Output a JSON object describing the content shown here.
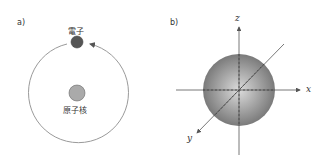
{
  "panel_a": {
    "label": "a)",
    "electron_label": "電子",
    "nucleus_label": "原子核",
    "colors": {
      "orbit": "#9a9a9a",
      "electron": "#555555",
      "nucleus": "#aaaaaa"
    }
  },
  "panel_b": {
    "label": "b)",
    "axis_x": "x",
    "axis_y": "y",
    "axis_z": "z",
    "colors": {
      "sphere_center": "#d8d8d8",
      "sphere_edge": "#7a7a7a",
      "axis": "#555555"
    }
  }
}
